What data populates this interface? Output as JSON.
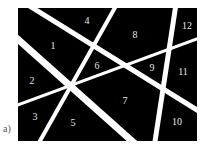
{
  "figure": {
    "panel_label": "a)",
    "background_color": "#000000",
    "line_color": "#ffffff",
    "label_color": "#e6e6e6",
    "rect": {
      "x": 18,
      "y": 8,
      "width": 179,
      "height": 133
    },
    "lines": [
      {
        "id": "L1",
        "x1": 28,
        "y1": 5,
        "x2": 205,
        "y2": 115,
        "width": 5
      },
      {
        "id": "L2",
        "x1": 12,
        "y1": 34,
        "x2": 142,
        "y2": 150,
        "width": 7
      },
      {
        "id": "L3",
        "x1": 117,
        "y1": 4,
        "x2": 36,
        "y2": 148,
        "width": 4
      },
      {
        "id": "L4",
        "x1": 12,
        "y1": 107,
        "x2": 205,
        "y2": 36,
        "width": 3
      },
      {
        "id": "L5",
        "x1": 176,
        "y1": 4,
        "x2": 154,
        "y2": 148,
        "width": 5
      }
    ],
    "regions": [
      {
        "label": "1",
        "x": 53,
        "y": 47
      },
      {
        "label": "2",
        "x": 32,
        "y": 82
      },
      {
        "label": "3",
        "x": 35,
        "y": 118
      },
      {
        "label": "4",
        "x": 87,
        "y": 22
      },
      {
        "label": "5",
        "x": 73,
        "y": 124
      },
      {
        "label": "6",
        "x": 97,
        "y": 67
      },
      {
        "label": "7",
        "x": 125,
        "y": 102
      },
      {
        "label": "8",
        "x": 135,
        "y": 36
      },
      {
        "label": "9",
        "x": 152,
        "y": 69
      },
      {
        "label": "10",
        "x": 177,
        "y": 123
      },
      {
        "label": "11",
        "x": 183,
        "y": 73
      },
      {
        "label": "12",
        "x": 187,
        "y": 27
      }
    ]
  }
}
